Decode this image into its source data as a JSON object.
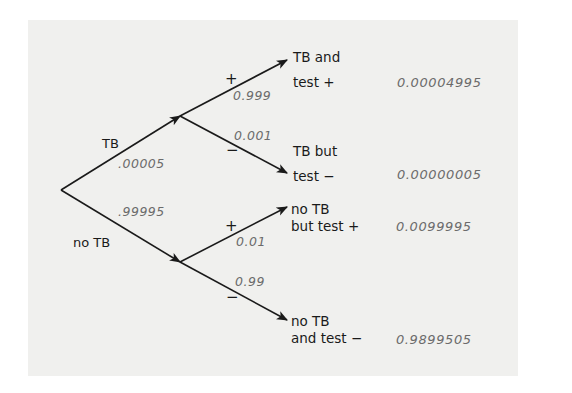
{
  "diagram": {
    "type": "probability-tree",
    "colors": {
      "panel_background": "#f0f0ee",
      "line": "#1a1a1a",
      "probability_text": "#6b6b6b",
      "label_text": "#1a1a1a"
    },
    "first_level": {
      "tb": {
        "label": "TB",
        "probability": ".00005"
      },
      "no_tb": {
        "label": "no TB",
        "probability": ".99995"
      }
    },
    "second_level": {
      "tb_positive": {
        "sign": "+",
        "probability": "0.999"
      },
      "tb_negative": {
        "sign": "−",
        "probability": "0.001"
      },
      "no_tb_positive": {
        "sign": "+",
        "probability": "0.01"
      },
      "no_tb_negative": {
        "sign": "−",
        "probability": "0.99"
      }
    },
    "outcomes": [
      {
        "line1": "TB and",
        "line2": "test +",
        "joint_probability": "0.00004995"
      },
      {
        "line1": "TB but",
        "line2": "test −",
        "joint_probability": "0.00000005"
      },
      {
        "line1": "no TB",
        "line2": "but test +",
        "joint_probability": "0.0099995"
      },
      {
        "line1": "no TB",
        "line2": "and test −",
        "joint_probability": "0.9899505"
      }
    ]
  }
}
